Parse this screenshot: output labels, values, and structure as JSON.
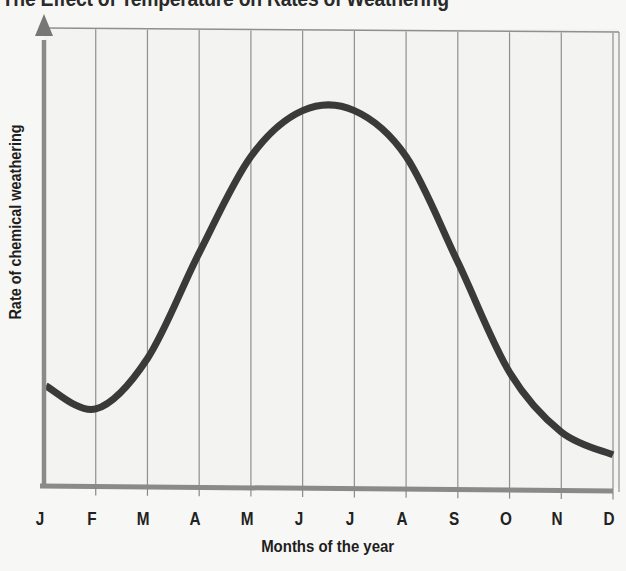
{
  "title": "The Effect of Temperature on Rates of Weathering",
  "axes": {
    "ylabel": "Rate of chemical weathering",
    "xlabel": "Months of the year"
  },
  "months": [
    "J",
    "F",
    "M",
    "A",
    "M",
    "J",
    "J",
    "A",
    "S",
    "O",
    "N",
    "D"
  ],
  "colors": {
    "background": "#f7f7f5",
    "curve": "#3a3a3a",
    "axes": "#8a8a8a",
    "grid": "#8f8f8f",
    "text": "#1e1e1e"
  },
  "chart_data": {
    "type": "line",
    "title": "The Effect of Temperature on Rates of Weathering",
    "xlabel": "Months of the year",
    "ylabel": "Rate of chemical weathering",
    "categories": [
      "J",
      "F",
      "M",
      "A",
      "M",
      "J",
      "J",
      "A",
      "S",
      "O",
      "N",
      "D"
    ],
    "series": [
      {
        "name": "Rate of chemical weathering (relative, estimated 0-10)",
        "values": [
          2.2,
          1.7,
          2.8,
          5.1,
          7.2,
          8.2,
          8.2,
          7.2,
          4.9,
          2.5,
          1.2,
          0.7
        ]
      }
    ],
    "ylim": [
      0,
      10
    ],
    "y_ticks_labeled": false,
    "grid": "vertical lines at each month",
    "legend": "none",
    "annotations": "Peak rate occurs between June and July; minimum near February and December"
  }
}
